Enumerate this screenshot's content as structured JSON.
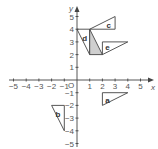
{
  "diagram": {
    "x_axis_label": "x",
    "y_axis_label": "y",
    "origin_label": "O",
    "x_ticks": [
      {
        "v": -5,
        "label": "−5"
      },
      {
        "v": -4,
        "label": "−4"
      },
      {
        "v": -3,
        "label": "−3"
      },
      {
        "v": -2,
        "label": "−2"
      },
      {
        "v": -1,
        "label": "−1"
      },
      {
        "v": 1,
        "label": "1"
      },
      {
        "v": 2,
        "label": "2"
      },
      {
        "v": 3,
        "label": "3"
      },
      {
        "v": 4,
        "label": "4"
      },
      {
        "v": 5,
        "label": "5"
      }
    ],
    "y_ticks": [
      {
        "v": 5,
        "label": "5"
      },
      {
        "v": 4,
        "label": "4"
      },
      {
        "v": 3,
        "label": "3"
      },
      {
        "v": 2,
        "label": "2"
      },
      {
        "v": 1,
        "label": "1"
      },
      {
        "v": -1,
        "label": "−1"
      },
      {
        "v": -2,
        "label": "−2"
      },
      {
        "v": -3,
        "label": "−3"
      },
      {
        "v": -4,
        "label": "−4"
      },
      {
        "v": -5,
        "label": "−5"
      }
    ],
    "shapes": [
      {
        "name": "c",
        "label": "c",
        "points": [
          [
            1,
            4
          ],
          [
            3,
            4
          ],
          [
            3,
            5
          ]
        ],
        "label_at": [
          2.5,
          4.3
        ],
        "shaded": false
      },
      {
        "name": "d",
        "label": "d",
        "points": [
          [
            0,
            4
          ],
          [
            1,
            4
          ],
          [
            1,
            2
          ]
        ],
        "label_at": [
          0.6,
          3.3
        ],
        "shaded": false
      },
      {
        "name": "shaded",
        "label": "",
        "points": [
          [
            1,
            4
          ],
          [
            1,
            2
          ],
          [
            2,
            2
          ]
        ],
        "shaded": true
      },
      {
        "name": "e",
        "label": "e",
        "points": [
          [
            2,
            2
          ],
          [
            2,
            3
          ],
          [
            4,
            3
          ]
        ],
        "label_at": [
          2.4,
          2.6
        ],
        "shaded": false
      },
      {
        "name": "a",
        "label": "a",
        "points": [
          [
            2,
            -1
          ],
          [
            4,
            -1
          ],
          [
            2,
            -2
          ]
        ],
        "label_at": [
          2.4,
          -1.6
        ],
        "shaded": false
      },
      {
        "name": "b",
        "label": "b",
        "points": [
          [
            -2,
            -2
          ],
          [
            -1,
            -2
          ],
          [
            -1,
            -4
          ]
        ],
        "label_at": [
          -1.5,
          -2.7
        ],
        "shaded": false
      }
    ]
  }
}
